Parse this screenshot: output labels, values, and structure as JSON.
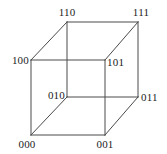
{
  "figure": {
    "type": "cube-graph-diagram",
    "background_color": "#ffffff",
    "edge_color": "#4a4a4a",
    "label_color": "#1b1b1b",
    "width": 167,
    "height": 154,
    "vertices": [
      {
        "id": "v110",
        "label": "110",
        "x": 67,
        "y": 22,
        "anchor": "center-above",
        "label_x": 67,
        "label_y": 18
      },
      {
        "id": "v111",
        "label": "111",
        "x": 138,
        "y": 22,
        "anchor": "center-above",
        "label_x": 141,
        "label_y": 18
      },
      {
        "id": "v100",
        "label": "100",
        "x": 31,
        "y": 60,
        "anchor": "right",
        "label_x": 29,
        "label_y": 60
      },
      {
        "id": "v101",
        "label": "101",
        "x": 105,
        "y": 60,
        "anchor": "left",
        "label_x": 107,
        "label_y": 62
      },
      {
        "id": "v010",
        "label": "010",
        "x": 67,
        "y": 97,
        "anchor": "right",
        "label_x": 65,
        "label_y": 95
      },
      {
        "id": "v011",
        "label": "011",
        "x": 138,
        "y": 97,
        "anchor": "left",
        "label_x": 141,
        "label_y": 97
      },
      {
        "id": "v000",
        "label": "000",
        "x": 31,
        "y": 135,
        "anchor": "center-below",
        "label_x": 27,
        "label_y": 139
      },
      {
        "id": "v001",
        "label": "001",
        "x": 105,
        "y": 135,
        "anchor": "center-below",
        "label_x": 105,
        "label_y": 139
      }
    ],
    "edges": [
      {
        "id": "e-100-101",
        "from": "v100",
        "to": "v101",
        "x1": 31,
        "y1": 60,
        "x2": 105,
        "y2": 60
      },
      {
        "id": "e-101-001",
        "from": "v101",
        "to": "v001",
        "x1": 105,
        "y1": 60,
        "x2": 105,
        "y2": 135
      },
      {
        "id": "e-001-000",
        "from": "v001",
        "to": "v000",
        "x1": 105,
        "y1": 135,
        "x2": 31,
        "y2": 135
      },
      {
        "id": "e-000-100",
        "from": "v000",
        "to": "v100",
        "x1": 31,
        "y1": 135,
        "x2": 31,
        "y2": 60
      },
      {
        "id": "e-110-111",
        "from": "v110",
        "to": "v111",
        "x1": 67,
        "y1": 22,
        "x2": 138,
        "y2": 22
      },
      {
        "id": "e-111-011",
        "from": "v111",
        "to": "v011",
        "x1": 138,
        "y1": 22,
        "x2": 138,
        "y2": 97
      },
      {
        "id": "e-011-010",
        "from": "v011",
        "to": "v010",
        "x1": 138,
        "y1": 97,
        "x2": 67,
        "y2": 97
      },
      {
        "id": "e-010-110",
        "from": "v010",
        "to": "v110",
        "x1": 67,
        "y1": 97,
        "x2": 67,
        "y2": 22
      },
      {
        "id": "e-100-110",
        "from": "v100",
        "to": "v110",
        "x1": 31,
        "y1": 60,
        "x2": 67,
        "y2": 22
      },
      {
        "id": "e-101-111",
        "from": "v101",
        "to": "v111",
        "x1": 105,
        "y1": 60,
        "x2": 138,
        "y2": 22
      },
      {
        "id": "e-000-010",
        "from": "v000",
        "to": "v010",
        "x1": 31,
        "y1": 135,
        "x2": 67,
        "y2": 97
      },
      {
        "id": "e-001-011",
        "from": "v001",
        "to": "v011",
        "x1": 105,
        "y1": 135,
        "x2": 138,
        "y2": 97
      }
    ]
  }
}
